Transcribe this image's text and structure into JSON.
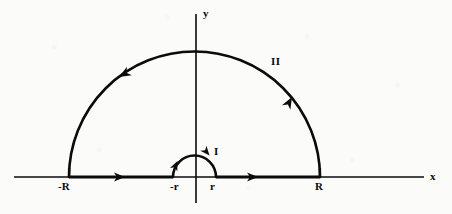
{
  "figure": {
    "kind": "complex-contour-diagram",
    "background_color": "#fbfbfa",
    "ink_color": "#0b0b0b"
  },
  "axes": {
    "x_axis": {
      "label": "x",
      "label_x": 430,
      "label_y": 171,
      "y_position": 177,
      "x_start": 14,
      "x_end": 424
    },
    "y_axis": {
      "label": "y",
      "label_x": 203,
      "label_y": 8,
      "x_position": 196,
      "y_start": 14,
      "y_end": 203
    },
    "origin": {
      "x": 196,
      "y": 177
    }
  },
  "tick_labels": [
    {
      "id": "minus-big-R",
      "text": "-R",
      "x": 58,
      "y": 181
    },
    {
      "id": "minus-small-r",
      "text": "-r",
      "x": 170,
      "y": 181
    },
    {
      "id": "small-r",
      "text": "r",
      "x": 210,
      "y": 181
    },
    {
      "id": "big-R",
      "text": "R",
      "x": 315,
      "y": 181
    }
  ],
  "curve_labels": [
    {
      "id": "small-arc-label",
      "text": "I",
      "x": 214,
      "y": 146
    },
    {
      "id": "big-arc-label",
      "text": "II",
      "x": 271,
      "y": 56
    }
  ],
  "contour": {
    "big_arc": {
      "name": "II",
      "center_x": 194.5,
      "center_y": 177,
      "radius": 125.5,
      "left_endpoint_x": 69,
      "right_endpoint_x": 320,
      "top_y": 51.5,
      "direction": "counterclockwise"
    },
    "small_arc": {
      "name": "I",
      "center_x": 194.5,
      "center_y": 177,
      "radius": 21.5,
      "left_endpoint_x": 173,
      "right_endpoint_x": 216,
      "top_y": 155.5,
      "direction": "clockwise"
    },
    "segments": [
      {
        "id": "left-segment",
        "from_label": "-R",
        "to_label": "-r",
        "x1": 69,
        "x2": 173,
        "y": 177,
        "direction": "rightward"
      },
      {
        "id": "right-segment",
        "from_label": "r",
        "to_label": "R",
        "x1": 216,
        "x2": 320,
        "y": 177,
        "direction": "rightward"
      }
    ],
    "arrowheads": [
      {
        "id": "left-segment-arrow",
        "x": 125,
        "y": 177,
        "angle_deg": 0,
        "on": "left-segment"
      },
      {
        "id": "right-segment-arrow",
        "x": 258,
        "y": 177,
        "angle_deg": 0,
        "on": "right-segment"
      },
      {
        "id": "big-arc-left-arrow",
        "x": 119,
        "y": 77,
        "angle_deg": 148,
        "on": "big-arc"
      },
      {
        "id": "big-arc-right-arrow",
        "x": 292,
        "y": 97,
        "angle_deg": -58,
        "on": "big-arc"
      },
      {
        "id": "small-arc-left-arrow",
        "x": 177,
        "y": 162,
        "angle_deg": -62,
        "on": "small-arc"
      },
      {
        "id": "small-arc-right-arrow",
        "x": 209,
        "y": 154,
        "angle_deg": 48,
        "on": "small-arc"
      }
    ]
  }
}
